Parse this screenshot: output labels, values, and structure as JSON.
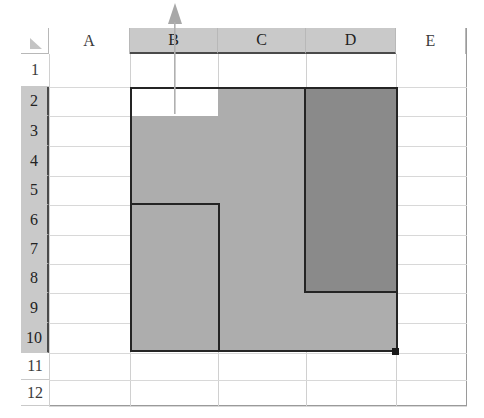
{
  "app": {
    "kind": "spreadsheet-grid",
    "select_all_icon": "select-all-triangle"
  },
  "columns": {
    "headers": [
      "A",
      "B",
      "C",
      "D",
      "E"
    ],
    "selected": [
      "B",
      "C",
      "D"
    ],
    "geometry": [
      {
        "label": "A",
        "x": 49,
        "width": 81
      },
      {
        "label": "B",
        "x": 130,
        "width": 88
      },
      {
        "label": "C",
        "x": 218,
        "width": 88
      },
      {
        "label": "D",
        "x": 306,
        "width": 90
      },
      {
        "label": "E",
        "x": 396,
        "width": 70
      }
    ]
  },
  "rows": {
    "headers": [
      "1",
      "2",
      "3",
      "4",
      "5",
      "6",
      "7",
      "8",
      "9",
      "10",
      "11",
      "12"
    ],
    "selected": [
      "2",
      "3",
      "4",
      "5",
      "6",
      "7",
      "8",
      "9",
      "10"
    ],
    "geometry": [
      {
        "label": "1",
        "y": 54,
        "height": 33
      },
      {
        "label": "2",
        "y": 87,
        "height": 29
      },
      {
        "label": "3",
        "y": 116,
        "height": 30
      },
      {
        "label": "4",
        "y": 146,
        "height": 30
      },
      {
        "label": "5",
        "y": 176,
        "height": 29
      },
      {
        "label": "6",
        "y": 205,
        "height": 30
      },
      {
        "label": "7",
        "y": 235,
        "height": 29
      },
      {
        "label": "8",
        "y": 264,
        "height": 29
      },
      {
        "label": "9",
        "y": 293,
        "height": 30
      },
      {
        "label": "10",
        "y": 323,
        "height": 30
      },
      {
        "label": "11",
        "y": 353,
        "height": 27
      },
      {
        "label": "12",
        "y": 380,
        "height": 26
      }
    ]
  },
  "selection": {
    "range": "B2:D10",
    "active_cell": "B2",
    "active_cell_fill": "#ffffff",
    "fill_handle": "fill-handle",
    "shades": [
      {
        "name": "range-bc-shade",
        "color": "#adadad",
        "x": 130,
        "y": 116,
        "width": 176,
        "height": 236
      },
      {
        "name": "range-c-top-shade",
        "color": "#adadad",
        "x": 218,
        "y": 87,
        "width": 88,
        "height": 29
      },
      {
        "name": "range-d-shade",
        "color": "#8a8a8a",
        "x": 306,
        "y": 87,
        "width": 90,
        "height": 206
      },
      {
        "name": "range-d-lower-shade",
        "color": "#adadad",
        "x": 306,
        "y": 293,
        "width": 90,
        "height": 59
      }
    ],
    "outline_color": "#242424",
    "outline_segments": [
      {
        "name": "outline-top",
        "x": 130,
        "y": 87,
        "width": 266,
        "height": 2
      },
      {
        "name": "outline-left",
        "x": 130,
        "y": 87,
        "width": 2,
        "height": 265
      },
      {
        "name": "outline-bottom",
        "x": 130,
        "y": 350,
        "width": 268,
        "height": 2
      },
      {
        "name": "outline-right",
        "x": 396,
        "y": 87,
        "width": 2,
        "height": 265
      },
      {
        "name": "outline-b-notch-top",
        "x": 130,
        "y": 203,
        "width": 90,
        "height": 2
      },
      {
        "name": "outline-b-notch-side",
        "x": 218,
        "y": 203,
        "width": 2,
        "height": 149
      },
      {
        "name": "outline-d-notch-side",
        "x": 304,
        "y": 87,
        "width": 2,
        "height": 206
      },
      {
        "name": "outline-d-notch-base",
        "x": 304,
        "y": 291,
        "width": 94,
        "height": 2
      }
    ]
  },
  "annotation": {
    "name": "up-arrow-pointer",
    "direction": "up",
    "color": "#a6a6a6",
    "points_at": "B2"
  }
}
